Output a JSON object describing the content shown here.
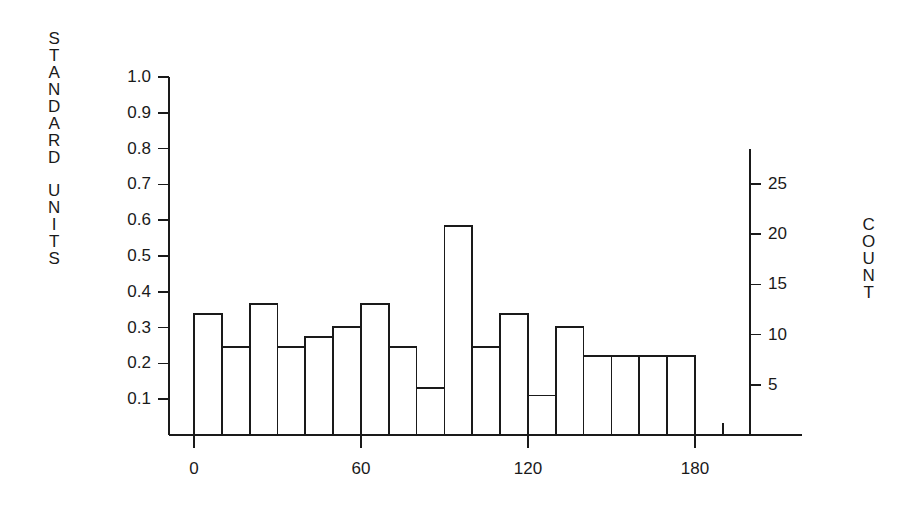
{
  "chart_data": {
    "type": "bar",
    "title": "",
    "subtitle": "",
    "xlabel": "",
    "ylabel": "STANDARD UNITS",
    "y2label": "COUNT",
    "grid": false,
    "legend": null,
    "xlim": [
      -10,
      200
    ],
    "ylim": [
      0.0,
      1.0
    ],
    "y2lim": [
      0,
      28.5
    ],
    "bin_width": 10,
    "x_tick_labels": [
      "0",
      "60",
      "120",
      "180"
    ],
    "x_tick_values": [
      0,
      60,
      120,
      180
    ],
    "x_minor_tick_step": 10,
    "y_tick_labels": [
      "0.1",
      "0.2",
      "0.3",
      "0.4",
      "0.5",
      "0.6",
      "0.7",
      "0.8",
      "0.9",
      "1.0"
    ],
    "y_tick_values": [
      0.1,
      0.2,
      0.3,
      0.4,
      0.5,
      0.6,
      0.7,
      0.8,
      0.9,
      1.0
    ],
    "y2_tick_labels": [
      "5",
      "10",
      "15",
      "20",
      "25"
    ],
    "y2_tick_values": [
      5,
      10,
      15,
      20,
      25
    ],
    "bin_starts": [
      0,
      10,
      20,
      30,
      40,
      50,
      60,
      70,
      80,
      90,
      100,
      110,
      120,
      130,
      140,
      150,
      160,
      170
    ],
    "categories": [
      "0-10",
      "10-20",
      "20-30",
      "30-40",
      "40-50",
      "50-60",
      "60-70",
      "70-80",
      "80-90",
      "90-100",
      "100-110",
      "110-120",
      "120-130",
      "130-140",
      "140-150",
      "150-160",
      "160-170",
      "170-180"
    ],
    "counts": [
      12,
      9,
      13,
      9,
      10,
      11,
      13,
      9,
      5,
      21,
      9,
      12,
      4,
      11,
      8,
      8,
      8,
      8
    ],
    "values": [
      0.338,
      0.246,
      0.366,
      0.246,
      0.274,
      0.302,
      0.366,
      0.246,
      0.131,
      0.584,
      0.246,
      0.338,
      0.11,
      0.302,
      0.221,
      0.221,
      0.221,
      0.221
    ],
    "colors": {
      "background": "#ffffff",
      "axis": "#1a1a1a",
      "bar_edge": "#1a1a1a",
      "bar_fill": "none",
      "text": "#1a1a1a"
    }
  },
  "axes": {
    "left_title_chars": [
      "S",
      "T",
      "A",
      "N",
      "D",
      "A",
      "R",
      "D",
      "",
      "U",
      "N",
      "I",
      "T",
      "S"
    ],
    "right_title_chars": [
      "C",
      "O",
      "U",
      "N",
      "T"
    ]
  }
}
